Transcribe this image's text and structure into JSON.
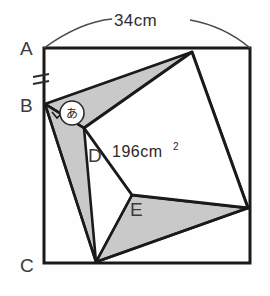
{
  "figure": {
    "background_color": "#fefefe",
    "stroke_color": "#1a1a1a",
    "shaded_color": "#c8c8c8",
    "label_color": "#3b3b3b",
    "outer_square": {
      "name": "outer-square-frame",
      "left": 44,
      "top": 48,
      "right": 250,
      "bottom": 263,
      "corner_labels": {
        "top_left": "A",
        "bottom_left": "C"
      }
    },
    "dimension": {
      "name": "top-width-dimension",
      "label": "34cm",
      "value": 34,
      "unit": "cm",
      "position": "top",
      "style": "arc-with-ticks"
    },
    "tick_mark": {
      "name": "equal-length-tick-AB",
      "glyph": "=",
      "on_segment": "AB"
    },
    "inner_square": {
      "name": "inner-tilted-square",
      "area_label": "196cm",
      "area_exponent": "2",
      "area_value": 196,
      "area_unit": "cm2",
      "vertices": [
        {
          "label": "D",
          "x": 84,
          "y": 128
        },
        {
          "label": "",
          "x": 192,
          "y": 52
        },
        {
          "label": "",
          "x": 248,
          "y": 208
        },
        {
          "label": "E",
          "x": 132,
          "y": 195
        }
      ]
    },
    "point_labels": [
      {
        "name": "label-A",
        "text": "A",
        "x": 20,
        "y": 55
      },
      {
        "name": "label-B",
        "text": "B",
        "x": 20,
        "y": 112
      },
      {
        "name": "label-C",
        "text": "C",
        "x": 20,
        "y": 272
      },
      {
        "name": "label-D",
        "text": "D",
        "x": 88,
        "y": 160
      },
      {
        "name": "label-E",
        "text": "E",
        "x": 132,
        "y": 218
      }
    ],
    "angle_marker": {
      "name": "angle-marker-a",
      "text": "あ",
      "cx": 72,
      "cy": 113,
      "r": 12
    },
    "key_points": {
      "B": {
        "x": 45,
        "y": 104
      },
      "top_vertex": {
        "x": 192,
        "y": 52
      },
      "right_vertex": {
        "x": 248,
        "y": 208
      },
      "bottom_vertex": {
        "x": 96,
        "y": 262
      }
    }
  }
}
